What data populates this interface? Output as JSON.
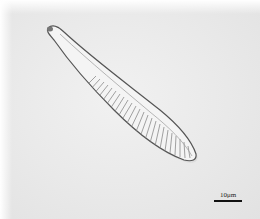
{
  "image": {
    "subject": "diatom",
    "background_color": "#e9e9e9",
    "specimen_outline_color": "#555555",
    "specimen_fill_color": "#f4f4f4",
    "striae_color": "#8a8a8a"
  },
  "scale_bar": {
    "label": "10μm",
    "color": "#111111"
  }
}
